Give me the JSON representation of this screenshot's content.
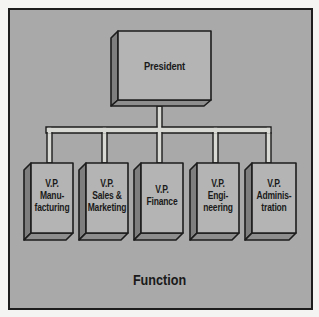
{
  "diagram": {
    "type": "org-chart",
    "caption": "Function",
    "colors": {
      "page": "#f4f4f2",
      "frame_fill": "#a9a9a9",
      "box_face": "#b4b4b4",
      "box_side": "#7e7e7e",
      "box_bottom": "#8e8e8e",
      "connector_fill": "#d8d8d4",
      "outline": "#1d1d1d"
    },
    "root": {
      "label": "President"
    },
    "children": [
      {
        "label": "V.P.\nManu-\nfacturing"
      },
      {
        "label": "V.P.\nSales &\nMarketing"
      },
      {
        "label": "V.P.\nFinance"
      },
      {
        "label": "V.P.\nEngi-\nneering"
      },
      {
        "label": "V.P.\nAdminis-\ntration"
      }
    ]
  }
}
